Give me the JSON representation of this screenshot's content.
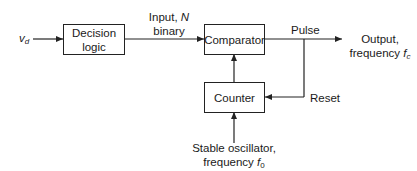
{
  "diagram": {
    "type": "block-diagram",
    "blocks": {
      "decision_logic": "Decision logic",
      "decision_logic_l1": "Decision",
      "decision_logic_l2": "logic",
      "comparator": "Comparator",
      "counter": "Counter"
    },
    "signals": {
      "input_v": "v",
      "input_v_sub": "d",
      "input_n_l1": "Input, ",
      "input_n_var": "N",
      "input_n_l2": "binary",
      "pulse": "Pulse",
      "output_l1": "Output,",
      "output_l2": "frequency ",
      "output_var": "f",
      "output_sub": "c",
      "reset": "Reset",
      "oscillator_l1": "Stable oscillator,",
      "oscillator_l2": "frequency ",
      "oscillator_var": "f",
      "oscillator_sub": "0"
    },
    "colors": {
      "line": "#222222",
      "background": "#ffffff"
    }
  }
}
